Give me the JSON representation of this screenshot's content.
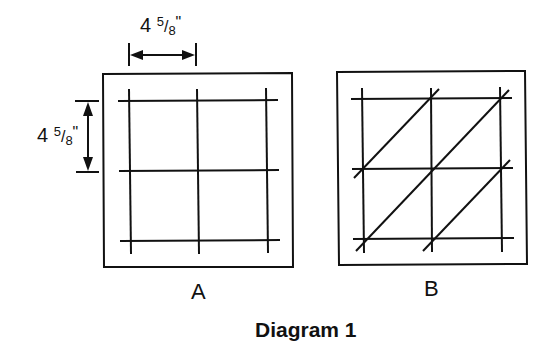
{
  "diagram": {
    "caption": "Diagram 1",
    "stroke_color": "#111111",
    "dimensions": {
      "horizontal": {
        "whole": "4",
        "num": "5",
        "den": "8",
        "unit": "\""
      },
      "vertical": {
        "whole": "4",
        "num": "5",
        "den": "8",
        "unit": "\""
      }
    },
    "panels": [
      {
        "label": "A",
        "description": "Square with 3x3 grid of lines forming 2x2 cells"
      },
      {
        "label": "B",
        "description": "Square with 3x3 grid of lines and diagonal lines through cells"
      }
    ]
  }
}
